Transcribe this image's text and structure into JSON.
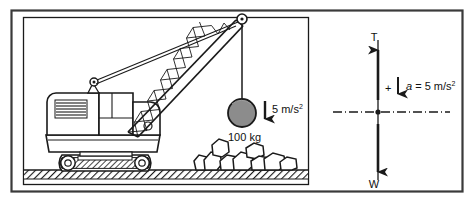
{
  "figure": {
    "type": "physics-free-body-diagram",
    "outer_frame": {
      "stroke": "#3a3a3a",
      "fill": "#ffffff"
    },
    "scene_panel": {
      "name": "crane-lifting-scene",
      "border_color": "#1a1a1a"
    },
    "scene": {
      "machine": "crawler-crane",
      "ground_label": "",
      "load": {
        "shape": "sphere",
        "mass_label": "100 kg",
        "fill_color": "#8c8c8c",
        "stroke_color": "#1a1a1a"
      },
      "acceleration_arrow": {
        "label": "5 m/s",
        "exponent": "2",
        "direction": "down"
      },
      "rubble": {
        "count": 9,
        "fill": "#ffffff",
        "stroke": "#1a1a1a"
      }
    },
    "free_body_diagram": {
      "name": "force-diagram",
      "tension_label": "T",
      "weight_label": "W",
      "sign_label": "+",
      "acceleration_text": "a",
      "acceleration_equals": " = 5 m/s",
      "acceleration_exponent": "2",
      "axis_style": "dash-dot",
      "axis_color": "#1a1a1a"
    },
    "colors": {
      "ink": "#1a1a1a",
      "frame": "#3a3a3a",
      "sphere": "#8c8c8c",
      "ground_hatch": "#1a1a1a"
    }
  }
}
